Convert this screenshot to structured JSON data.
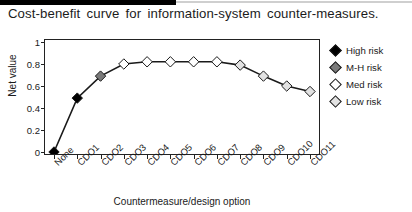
{
  "figure": {
    "title": "Cost-benefit curve for information-system counter-measures.",
    "x_axis_title": "Countermeasure/design option",
    "y_axis_title": "Net value"
  },
  "legend": {
    "items": [
      {
        "label": "High risk",
        "color": "#000000",
        "marker": "filled-diamond-icon"
      },
      {
        "label": "M-H risk",
        "color": "#7a7a7a",
        "marker": "gray-diamond-icon"
      },
      {
        "label": "Med risk",
        "color": "#ffffff",
        "marker": "open-diamond-icon"
      },
      {
        "label": "Low risk",
        "color": "#e2e2e2",
        "marker": "light-diamond-icon"
      }
    ]
  },
  "chart_data": {
    "type": "line",
    "title": "Cost-benefit curve for information-system counter-measures.",
    "xlabel": "Countermeasure/design option",
    "ylabel": "Net value",
    "ylim": [
      0,
      1
    ],
    "yticks": [
      "0",
      "0.2",
      "0.4",
      "0.6",
      "0.8",
      "1"
    ],
    "ytick_values": [
      0,
      0.2,
      0.4,
      0.6,
      0.8,
      1
    ],
    "grid": false,
    "legend_position": "right",
    "categories": [
      "None",
      "CDO1",
      "CDO2",
      "CDO3",
      "CDO4",
      "CDO5",
      "CDO6",
      "CDO7",
      "CDO8",
      "CDO9",
      "CDO10",
      "CDO11"
    ],
    "series": [
      {
        "name": "Net value",
        "values": [
          0.0,
          0.49,
          0.69,
          0.8,
          0.82,
          0.82,
          0.82,
          0.82,
          0.79,
          0.69,
          0.6,
          0.55
        ],
        "point_risk": [
          "High risk",
          "High risk",
          "M-H risk",
          "Med risk",
          "Med risk",
          "Med risk",
          "Med risk",
          "Med risk",
          "Low risk",
          "Low risk",
          "Low risk",
          "Low risk"
        ],
        "point_colors": [
          "#000000",
          "#000000",
          "#7a7a7a",
          "#ffffff",
          "#ffffff",
          "#ffffff",
          "#ffffff",
          "#ffffff",
          "#e2e2e2",
          "#e2e2e2",
          "#e2e2e2",
          "#e2e2e2"
        ],
        "line_color": "#1a1a1a"
      }
    ]
  }
}
